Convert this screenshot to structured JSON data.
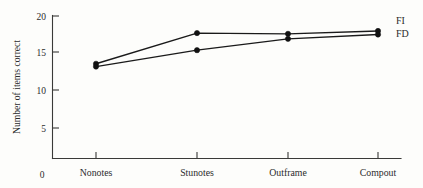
{
  "chart_data": {
    "type": "line",
    "title": "",
    "xlabel": "",
    "ylabel": "Number of items correct",
    "categories": [
      "Nonotes",
      "Stunotes",
      "Outframe",
      "Compout"
    ],
    "series": [
      {
        "name": "FI",
        "values": [
          13.3,
          17.6,
          17.5,
          17.9
        ]
      },
      {
        "name": "FD",
        "values": [
          12.9,
          15.2,
          16.8,
          17.4
        ]
      }
    ],
    "ylim": [
      0,
      20
    ],
    "yticks": [
      0,
      5,
      10,
      15,
      20
    ],
    "ytick_labels": [
      "0",
      "5",
      "10",
      "15",
      "20"
    ],
    "grid": false,
    "legend_position": "right-inline",
    "marker": "filled-circle",
    "line_color": "#111111"
  },
  "axes": {
    "y_title": "Number of items correct",
    "origin_label": "0",
    "tick_labels": {
      "t20": "20",
      "t15": "15",
      "t10": "10",
      "t5": "5"
    }
  },
  "categories": {
    "c0": "Nonotes",
    "c1": "Stunotes",
    "c2": "Outframe",
    "c3": "Compout"
  },
  "legend": {
    "fi": "FI",
    "fd": "FD"
  }
}
